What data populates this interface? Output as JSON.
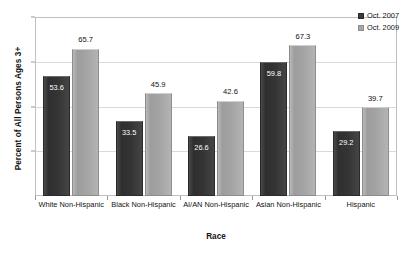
{
  "chart_data": {
    "type": "bar",
    "title": "",
    "xlabel": "Race",
    "ylabel": "Percent of All Persons Ages 3+",
    "ylim": [
      0,
      80
    ],
    "yticks": [
      20,
      40,
      60,
      80
    ],
    "grid": true,
    "legend_position": "top-right",
    "categories": [
      "White Non-Hispanic",
      "Black Non-Hispanic",
      "AI/AN Non-Hispanic",
      "Asian Non-Hispanic",
      "Hispanic"
    ],
    "series": [
      {
        "name": "Oct. 2007",
        "color": "#3a3a3a",
        "label_placement": "inside",
        "values": [
          53.6,
          33.5,
          26.6,
          59.8,
          29.2
        ]
      },
      {
        "name": "Oct. 2009",
        "color": "#a8a8a8",
        "label_placement": "outside",
        "values": [
          65.7,
          45.9,
          42.6,
          67.3,
          39.7
        ]
      }
    ]
  }
}
